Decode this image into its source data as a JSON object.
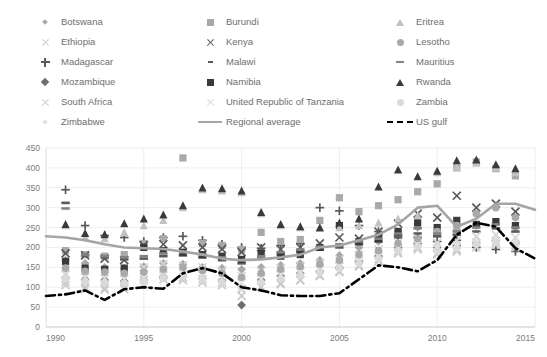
{
  "legend": {
    "columns": [
      {
        "items": [
          {
            "label": "Botswana",
            "icon": "diamond-marker",
            "shape": "diamond",
            "color": "#a7a9ac",
            "size": "sm"
          },
          {
            "label": "Ethiopia",
            "icon": "x-marker",
            "shape": "x",
            "color": "#c9cacc",
            "size": "md"
          },
          {
            "label": "Madagascar",
            "icon": "plus-marker",
            "shape": "plus",
            "color": "#58595b",
            "size": "md"
          },
          {
            "label": "Mozambique",
            "icon": "diamond-marker",
            "shape": "diamond",
            "color": "#6d6e71",
            "size": "md"
          },
          {
            "label": "South Africa",
            "icon": "x-marker",
            "shape": "x",
            "color": "#c9cacc",
            "size": "md"
          },
          {
            "label": "Zimbabwe",
            "icon": "diamond-marker",
            "shape": "diamond",
            "color": "#e2e3e4",
            "size": "sm"
          }
        ]
      },
      {
        "items": [
          {
            "label": "Burundi",
            "icon": "square-marker",
            "shape": "square",
            "color": "#a7a9ac",
            "size": "md"
          },
          {
            "label": "Kenya",
            "icon": "x-marker",
            "shape": "x",
            "color": "#58595b",
            "size": "md"
          },
          {
            "label": "Malawi",
            "icon": "dash-marker",
            "shape": "dash",
            "color": "#58595b",
            "size": "sm"
          },
          {
            "label": "Namibia",
            "icon": "square-marker",
            "shape": "square",
            "color": "#3a3a3c",
            "size": "md"
          },
          {
            "label": "United Republic of Tanzania",
            "icon": "x-marker",
            "shape": "x",
            "color": "#d5d6d8",
            "size": "md"
          },
          {
            "label": "Regional average",
            "icon": "solid-line",
            "shape": "line",
            "color": "#a3a6a3",
            "size": "md"
          }
        ]
      },
      {
        "items": [
          {
            "label": "Eritrea",
            "icon": "triangle-marker",
            "shape": "triangle",
            "color": "#c0c2c4",
            "size": "md"
          },
          {
            "label": "Lesotho",
            "icon": "circle-marker",
            "shape": "circle",
            "color": "#a7a9ac",
            "size": "md"
          },
          {
            "label": "Mauritius",
            "icon": "dash-marker",
            "shape": "dash",
            "color": "#808285",
            "size": "md"
          },
          {
            "label": "Rwanda",
            "icon": "triangle-marker",
            "shape": "triangle",
            "color": "#3a3a3c",
            "size": "md"
          },
          {
            "label": "Zambia",
            "icon": "circle-marker",
            "shape": "circle",
            "color": "#d9dadb",
            "size": "md"
          },
          {
            "label": "US gulf",
            "icon": "dash-dot-line",
            "shape": "dashdot",
            "color": "#000000",
            "size": "md"
          }
        ]
      }
    ]
  },
  "axes": {
    "y_ticks": [
      "450",
      "400",
      "350",
      "300",
      "250",
      "200",
      "150",
      "100",
      "50",
      "0"
    ],
    "x_ticks": [
      "1990",
      "1995",
      "2000",
      "2005",
      "2010",
      "2015"
    ],
    "ylim": [
      0,
      450
    ],
    "xlim": [
      1990,
      2015
    ],
    "grid": true
  },
  "chart_data": {
    "type": "scatter",
    "title": "",
    "xlabel": "",
    "ylabel": "",
    "xlim": [
      1990,
      2015
    ],
    "ylim": [
      0,
      450
    ],
    "grid": true,
    "legend_position": "top",
    "x": [
      1991,
      1992,
      1993,
      1994,
      1995,
      1996,
      1997,
      1998,
      1999,
      2000,
      2001,
      2002,
      2003,
      2004,
      2005,
      2006,
      2007,
      2008,
      2009,
      2010,
      2011,
      2012,
      2013,
      2014
    ],
    "series": [
      {
        "name": "Botswana",
        "marker": "diamond",
        "color": "#a7a9ac",
        "values": [
          168,
          160,
          150,
          148,
          152,
          160,
          158,
          150,
          148,
          145,
          150,
          155,
          160,
          168,
          180,
          200,
          215,
          240,
          250,
          235,
          245,
          255,
          260,
          250
        ]
      },
      {
        "name": "Ethiopia",
        "marker": "x",
        "color": "#c9cacc",
        "values": [
          113,
          100,
          98,
          100,
          118,
          130,
          125,
          120,
          112,
          95,
          100,
          110,
          118,
          130,
          140,
          155,
          170,
          190,
          200,
          185,
          195,
          210,
          215,
          205
        ]
      },
      {
        "name": "Madagascar",
        "marker": "plus",
        "color": "#58595b",
        "values": [
          345,
          255,
          230,
          225,
          215,
          225,
          228,
          218,
          208,
          200,
          198,
          205,
          210,
          300,
          292,
          255,
          240,
          230,
          225,
          215,
          218,
          200,
          195,
          190
        ]
      },
      {
        "name": "Mozambique",
        "marker": "diamond",
        "color": "#6d6e71",
        "values": [
          125,
          120,
          118,
          115,
          118,
          125,
          128,
          122,
          115,
          55,
          118,
          128,
          135,
          140,
          150,
          165,
          178,
          200,
          210,
          200,
          205,
          212,
          218,
          210
        ]
      },
      {
        "name": "South Africa",
        "marker": "x",
        "color": "#c9cacc",
        "values": [
          105,
          95,
          93,
          95,
          108,
          120,
          118,
          112,
          105,
          78,
          100,
          108,
          118,
          128,
          138,
          152,
          165,
          185,
          195,
          182,
          190,
          200,
          208,
          200
        ]
      },
      {
        "name": "Zimbabwe",
        "marker": "diamond",
        "color": "#e2e3e4",
        "values": [
          140,
          135,
          132,
          128,
          132,
          140,
          142,
          138,
          130,
          118,
          128,
          138,
          145,
          152,
          160,
          172,
          185,
          205,
          215,
          205,
          210,
          218,
          222,
          215
        ]
      },
      {
        "name": "Burundi",
        "marker": "square",
        "color": "#a7a9ac",
        "values": [
          192,
          182,
          178,
          182,
          210,
          222,
          425,
          210,
          205,
          195,
          238,
          215,
          220,
          268,
          325,
          290,
          305,
          320,
          340,
          360,
          400,
          415,
          398,
          380
        ]
      },
      {
        "name": "Kenya",
        "marker": "x",
        "color": "#58595b",
        "values": [
          185,
          180,
          172,
          168,
          205,
          208,
          205,
          200,
          196,
          188,
          200,
          195,
          200,
          210,
          225,
          222,
          240,
          260,
          285,
          275,
          330,
          300,
          310,
          290
        ]
      },
      {
        "name": "Malawi",
        "marker": "dash",
        "color": "#58595b",
        "values": [
          312,
          180,
          175,
          170,
          172,
          178,
          180,
          175,
          168,
          160,
          172,
          182,
          190,
          195,
          200,
          208,
          215,
          225,
          235,
          228,
          232,
          240,
          248,
          240
        ]
      },
      {
        "name": "Namibia",
        "marker": "square",
        "color": "#3a3a3c",
        "values": [
          165,
          148,
          145,
          148,
          200,
          192,
          188,
          182,
          178,
          170,
          185,
          178,
          182,
          200,
          255,
          215,
          222,
          240,
          262,
          250,
          268,
          258,
          265,
          255
        ]
      },
      {
        "name": "United Republic of Tanzania",
        "marker": "x",
        "color": "#d5d6d8",
        "values": [
          132,
          125,
          122,
          120,
          150,
          158,
          155,
          150,
          142,
          128,
          140,
          148,
          155,
          162,
          170,
          182,
          195,
          212,
          222,
          212,
          218,
          228,
          232,
          225
        ]
      },
      {
        "name": "Eritrea",
        "marker": "triangle",
        "color": "#c0c2c4",
        "values": [
          255,
          225,
          222,
          238,
          255,
          268,
          300,
          345,
          342,
          338,
          285,
          255,
          250,
          248,
          250,
          255,
          262,
          272,
          280,
          388,
          402,
          412,
          400,
          388
        ]
      },
      {
        "name": "Lesotho",
        "marker": "circle",
        "color": "#a7a9ac",
        "values": [
          148,
          140,
          138,
          135,
          138,
          145,
          150,
          142,
          135,
          125,
          135,
          145,
          152,
          158,
          168,
          182,
          192,
          210,
          222,
          240,
          255,
          285,
          300,
          275
        ]
      },
      {
        "name": "Mauritius",
        "marker": "dash",
        "color": "#808285",
        "values": [
          298,
          182,
          178,
          175,
          178,
          185,
          188,
          182,
          175,
          168,
          178,
          188,
          195,
          202,
          208,
          215,
          222,
          235,
          248,
          235,
          240,
          250,
          258,
          250
        ]
      },
      {
        "name": "Rwanda",
        "marker": "triangle",
        "color": "#3a3a3c",
        "values": [
          258,
          235,
          232,
          260,
          272,
          282,
          305,
          350,
          348,
          342,
          288,
          258,
          252,
          250,
          262,
          272,
          352,
          395,
          378,
          392,
          418,
          420,
          408,
          398
        ]
      },
      {
        "name": "Zambia",
        "marker": "circle",
        "color": "#d9dadb",
        "values": [
          122,
          115,
          112,
          110,
          115,
          122,
          128,
          120,
          112,
          100,
          112,
          122,
          130,
          138,
          148,
          160,
          172,
          192,
          202,
          192,
          198,
          208,
          212,
          205
        ]
      }
    ],
    "lines": [
      {
        "name": "Regional average",
        "style": "solid",
        "color": "#a3a6a3",
        "width": 2.6,
        "x": [
          1990,
          1991,
          1992,
          1993,
          1994,
          1995,
          1996,
          1997,
          1998,
          1999,
          2000,
          2001,
          2002,
          2003,
          2004,
          2005,
          2006,
          2007,
          2008,
          2009,
          2010,
          2011,
          2012,
          2013,
          2014,
          2015
        ],
        "values": [
          228,
          225,
          218,
          208,
          200,
          198,
          196,
          190,
          182,
          172,
          168,
          170,
          175,
          182,
          200,
          205,
          218,
          232,
          258,
          300,
          305,
          252,
          272,
          310,
          310,
          295
        ]
      },
      {
        "name": "US gulf",
        "style": "dash-dot",
        "color": "#000000",
        "width": 2.6,
        "x": [
          1990,
          1991,
          1992,
          1993,
          1994,
          1995,
          1996,
          1997,
          1998,
          1999,
          2000,
          2001,
          2002,
          2003,
          2004,
          2005,
          2006,
          2007,
          2008,
          2009,
          2010,
          2011,
          2012,
          2013,
          2014,
          2015
        ],
        "values": [
          78,
          82,
          92,
          68,
          95,
          100,
          96,
          135,
          148,
          135,
          100,
          92,
          80,
          78,
          78,
          85,
          120,
          155,
          150,
          140,
          168,
          232,
          262,
          252,
          198,
          172
        ]
      }
    ]
  }
}
